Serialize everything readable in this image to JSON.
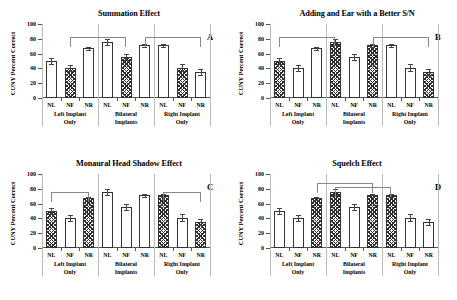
{
  "figure": {
    "ylabel": "CUNY Percent Correct",
    "y_ticks": [
      0,
      20,
      40,
      60,
      80,
      100
    ],
    "ylim": [
      0,
      100
    ],
    "bar_labels": [
      "NL",
      "NF",
      "NR",
      "NL",
      "NF",
      "NR",
      "NL",
      "NF",
      "NR"
    ],
    "group_labels": [
      {
        "line1": "Left Implant",
        "line2": "Only"
      },
      {
        "line1": "Bilateral",
        "line2": "Implants"
      },
      {
        "line1": "Right Implant",
        "line2": "Only"
      }
    ]
  },
  "chart_data": [
    {
      "type": "bar",
      "panel": "A",
      "title": "Summation Effect",
      "xlabel": "",
      "ylabel": "CUNY Percent Correct",
      "ylim": [
        0,
        100
      ],
      "grid": false,
      "categories": [
        "NL",
        "NF",
        "NR",
        "NL",
        "NF",
        "NR",
        "NL",
        "NF",
        "NR"
      ],
      "groups": [
        "Left Implant Only",
        "Left Implant Only",
        "Left Implant Only",
        "Bilateral Implants",
        "Bilateral Implants",
        "Bilateral Implants",
        "Right Implant Only",
        "Right Implant Only",
        "Right Implant Only"
      ],
      "values": [
        50,
        41,
        67,
        76,
        56,
        71,
        71,
        41,
        35
      ],
      "errors": [
        4,
        4,
        2,
        4,
        4,
        2,
        2,
        5,
        4
      ],
      "fills": [
        "open",
        "hatched",
        "open",
        "open",
        "hatched",
        "open",
        "open",
        "hatched",
        "open"
      ],
      "brackets": [
        {
          "from": 1,
          "to": 4,
          "y": 83
        },
        {
          "from": 5,
          "to": 8,
          "y": 83
        }
      ]
    },
    {
      "type": "bar",
      "panel": "B",
      "title": "Adding and Ear with a Better S/N",
      "xlabel": "",
      "ylabel": "CUNY Percent Correct",
      "ylim": [
        0,
        100
      ],
      "grid": false,
      "categories": [
        "NL",
        "NF",
        "NR",
        "NL",
        "NF",
        "NR",
        "NL",
        "NF",
        "NR"
      ],
      "groups": [
        "Left Implant Only",
        "Left Implant Only",
        "Left Implant Only",
        "Bilateral Implants",
        "Bilateral Implants",
        "Bilateral Implants",
        "Right Implant Only",
        "Right Implant Only",
        "Right Implant Only"
      ],
      "values": [
        50,
        41,
        67,
        76,
        56,
        71,
        71,
        41,
        35
      ],
      "errors": [
        4,
        4,
        2,
        4,
        4,
        2,
        2,
        5,
        4
      ],
      "fills": [
        "hatched",
        "open",
        "open",
        "hatched",
        "open",
        "hatched",
        "open",
        "open",
        "hatched"
      ],
      "brackets": [
        {
          "from": 0,
          "to": 3,
          "y": 83
        },
        {
          "from": 5,
          "to": 8,
          "y": 83
        }
      ]
    },
    {
      "type": "bar",
      "panel": "C",
      "title": "Monaural Head Shadow Effect",
      "xlabel": "",
      "ylabel": "CUNY Percent Correct",
      "ylim": [
        0,
        100
      ],
      "grid": false,
      "categories": [
        "NL",
        "NF",
        "NR",
        "NL",
        "NF",
        "NR",
        "NL",
        "NF",
        "NR"
      ],
      "groups": [
        "Left Implant Only",
        "Left Implant Only",
        "Left Implant Only",
        "Bilateral Implants",
        "Bilateral Implants",
        "Bilateral Implants",
        "Right Implant Only",
        "Right Implant Only",
        "Right Implant Only"
      ],
      "values": [
        50,
        41,
        67,
        76,
        56,
        71,
        71,
        41,
        35
      ],
      "errors": [
        4,
        4,
        2,
        4,
        4,
        2,
        2,
        5,
        4
      ],
      "fills": [
        "hatched",
        "open",
        "hatched",
        "open",
        "open",
        "open",
        "hatched",
        "open",
        "hatched"
      ],
      "brackets": [
        {
          "from": 0,
          "to": 2,
          "y": 76
        },
        {
          "from": 6,
          "to": 8,
          "y": 76
        }
      ]
    },
    {
      "type": "bar",
      "panel": "D",
      "title": "Squelch Effect",
      "xlabel": "",
      "ylabel": "CUNY Percent Correct",
      "ylim": [
        0,
        100
      ],
      "grid": false,
      "categories": [
        "NL",
        "NF",
        "NR",
        "NL",
        "NF",
        "NR",
        "NL",
        "NF",
        "NR"
      ],
      "groups": [
        "Left Implant Only",
        "Left Implant Only",
        "Left Implant Only",
        "Bilateral Implants",
        "Bilateral Implants",
        "Bilateral Implants",
        "Right Implant Only",
        "Right Implant Only",
        "Right Implant Only"
      ],
      "values": [
        50,
        41,
        67,
        76,
        56,
        71,
        71,
        41,
        35
      ],
      "errors": [
        4,
        4,
        2,
        4,
        4,
        2,
        2,
        5,
        4
      ],
      "fills": [
        "open",
        "open",
        "hatched",
        "hatched",
        "open",
        "hatched",
        "hatched",
        "open",
        "open"
      ],
      "brackets": [
        {
          "from": 2,
          "to": 5,
          "y": 88
        },
        {
          "from": 3,
          "to": 6,
          "y": 83
        }
      ]
    }
  ]
}
